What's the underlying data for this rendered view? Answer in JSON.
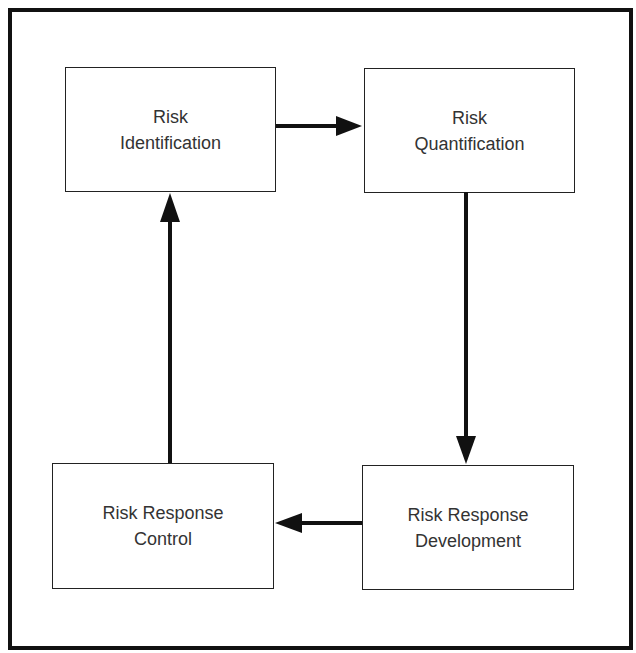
{
  "diagram": {
    "type": "cycle-flowchart",
    "nodes": [
      {
        "id": "identification",
        "line1": "Risk",
        "line2": "Identification"
      },
      {
        "id": "quantification",
        "line1": "Risk",
        "line2": "Quantification"
      },
      {
        "id": "response_development",
        "line1": "Risk Response",
        "line2": "Development"
      },
      {
        "id": "response_control",
        "line1": "Risk Response",
        "line2": "Control"
      }
    ],
    "edges": [
      {
        "from": "identification",
        "to": "quantification"
      },
      {
        "from": "quantification",
        "to": "response_development"
      },
      {
        "from": "response_development",
        "to": "response_control"
      },
      {
        "from": "response_control",
        "to": "identification"
      }
    ],
    "colors": {
      "stroke": "#111111",
      "text": "#333333",
      "background": "#ffffff"
    }
  }
}
